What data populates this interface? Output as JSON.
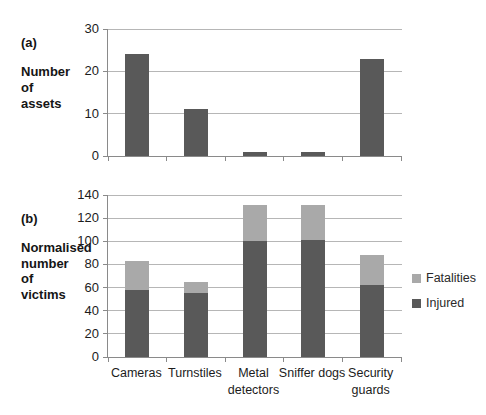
{
  "figure": {
    "background": "#ffffff"
  },
  "chart_data": [
    {
      "id": "a",
      "type": "bar",
      "panel_label": "(a)",
      "ylabel": "Number of assets",
      "ylabel_lines": [
        "Number",
        "of",
        "assets"
      ],
      "categories": [
        "Cameras",
        "Turnstiles",
        "Metal detectors",
        "Sniffer dogs",
        "Security guards"
      ],
      "values": [
        24,
        11,
        1,
        1,
        23
      ],
      "ylim": [
        0,
        30
      ],
      "yticks": [
        0,
        10,
        20,
        30
      ],
      "bar_color": "#595959",
      "grid": true,
      "legend": "none",
      "show_x_labels": false
    },
    {
      "id": "b",
      "type": "stacked-bar",
      "panel_label": "(b)",
      "ylabel": "Normalised number of victims",
      "ylabel_lines": [
        "Normalised",
        "number",
        "of",
        "victims"
      ],
      "categories": [
        "Cameras",
        "Turnstiles",
        "Metal detectors",
        "Sniffer dogs",
        "Security guards"
      ],
      "series": [
        {
          "name": "Injured",
          "color": "#595959",
          "values": [
            58,
            55,
            100,
            101,
            62
          ]
        },
        {
          "name": "Fatalities",
          "color": "#a9a9a9",
          "values": [
            25,
            10,
            31,
            30,
            26
          ]
        }
      ],
      "stack_totals": [
        83,
        65,
        131,
        131,
        88
      ],
      "ylim": [
        0,
        140
      ],
      "yticks": [
        0,
        20,
        40,
        60,
        80,
        100,
        120,
        140
      ],
      "grid": true,
      "legend": "right",
      "show_x_labels": true,
      "x_labels_display": [
        [
          "Cameras"
        ],
        [
          "Turnstiles"
        ],
        [
          "Metal",
          "detectors"
        ],
        [
          "Sniffer dogs"
        ],
        [
          "Security",
          "guards"
        ]
      ]
    }
  ],
  "legend": {
    "position": "right",
    "items": [
      {
        "label": "Fatalities",
        "color": "#a9a9a9"
      },
      {
        "label": "Injured",
        "color": "#595959"
      }
    ]
  }
}
